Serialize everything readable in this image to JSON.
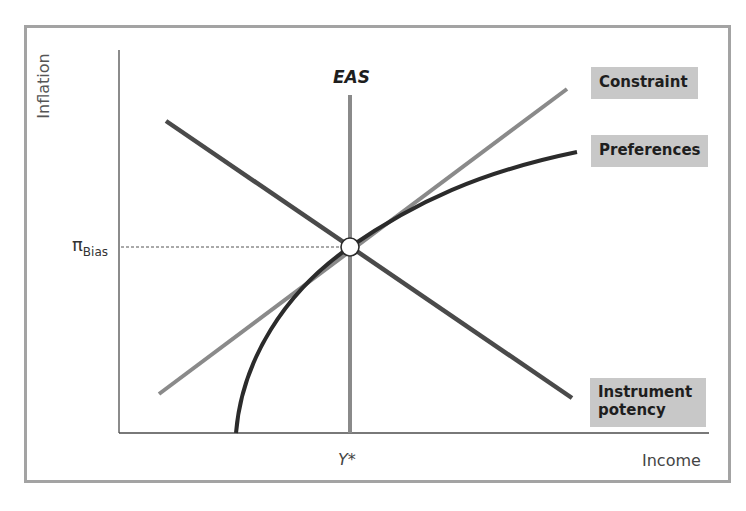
{
  "diagram": {
    "y_axis_label": "Inflation",
    "x_axis_label": "Income",
    "y_marker_label_main": "π",
    "y_marker_label_sub": "Bias",
    "x_marker_label": "Y*",
    "vertical_curve_label": "EAS",
    "curves": [
      {
        "name": "EAS",
        "label": "EAS",
        "color": "#8a8a8a",
        "shape": "vertical line at Y*"
      },
      {
        "name": "Constraint",
        "label": "Constraint",
        "color": "#8a8a8a",
        "shape": "upward sloping line"
      },
      {
        "name": "Preferences",
        "label": "Preferences",
        "color": "#2b2b2b",
        "shape": "concave curve"
      },
      {
        "name": "Instrument potency",
        "label_line1": "Instrument",
        "label_line2": "potency",
        "color": "#4a4a4a",
        "shape": "downward sloping line"
      }
    ],
    "equilibrium_point": {
      "x_label": "Y*",
      "y_label": "πBias",
      "marker": "open circle"
    },
    "label_box_color": "#c8c8c8",
    "frame_color": "#a3a3a3"
  }
}
